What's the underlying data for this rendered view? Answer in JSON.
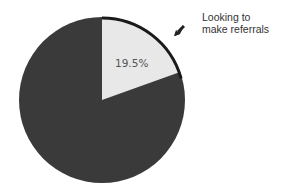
{
  "chart_data": {
    "type": "pie",
    "title": "",
    "slices": [
      {
        "label": "Looking to make referrals",
        "value": 19.5,
        "color": "#e8e8e8"
      },
      {
        "label": "",
        "value": 80.5,
        "color": "#3a3a3a"
      }
    ],
    "annotations": [
      {
        "text": "19.5%",
        "target": "Looking to make referrals"
      },
      {
        "text": "Looking to make referrals",
        "type": "callout-arrow"
      }
    ]
  },
  "labels": {
    "callout_line1": "Looking to",
    "callout_line2": "make referrals",
    "percent": "19.5%"
  },
  "colors": {
    "dark_slice": "#3a3a3a",
    "light_slice": "#e8e8e8",
    "outline": "#1e1e1e"
  }
}
